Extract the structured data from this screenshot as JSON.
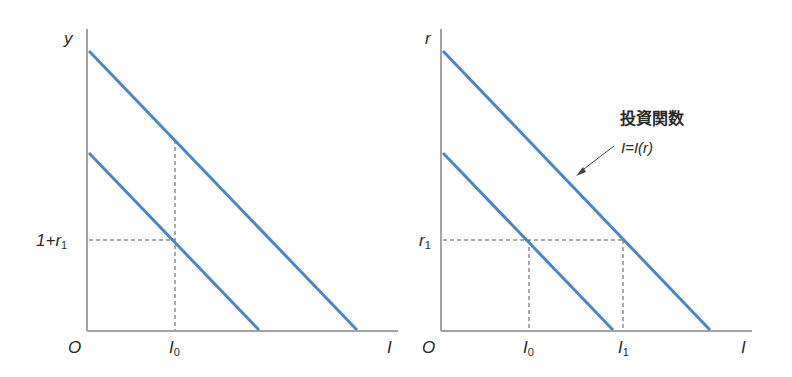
{
  "colors": {
    "curve": "#4a86c8",
    "axis": "#a3a3a3",
    "dash": "#555555",
    "text": "#2a2a2a"
  },
  "left_panel": {
    "y_axis_label": "y",
    "x_axis_label": "I",
    "origin_label": "O",
    "y_tick_label_main": "1+r",
    "y_tick_label_sub": "1",
    "x_tick_label_main": "I",
    "x_tick_label_sub": "0"
  },
  "right_panel": {
    "y_axis_label": "r",
    "x_axis_label": "I",
    "origin_label": "O",
    "y_tick_label_main": "r",
    "y_tick_label_sub": "1",
    "x_tick_labels": [
      {
        "main": "I",
        "sub": "0"
      },
      {
        "main": "I",
        "sub": "1"
      }
    ],
    "annotation_title": "投資関数",
    "annotation_formula": "I=I(r)"
  }
}
